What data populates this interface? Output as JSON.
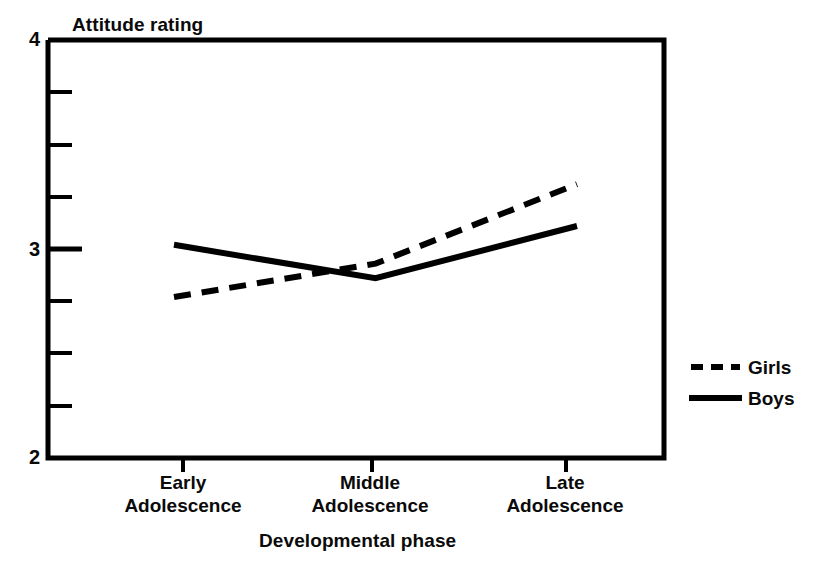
{
  "chart_data": {
    "type": "line",
    "title": "",
    "ylabel": "Attitude rating",
    "xlabel": "Developmental phase",
    "categories": [
      "Early\nAdolescence",
      "Middle\nAdolescence",
      "Late\nAdolescence"
    ],
    "category_labels": [
      {
        "line1": "Early",
        "line2": "Adolescence"
      },
      {
        "line1": "Middle",
        "line2": "Adolescence"
      },
      {
        "line1": "Late",
        "line2": "Adolescence"
      }
    ],
    "ylim": [
      2,
      4
    ],
    "ytick_labels": [
      "4",
      "3",
      "2"
    ],
    "ytick_values": [
      4,
      3,
      2
    ],
    "yminor_step": 0.25,
    "grid": false,
    "legend_position": "right",
    "series": [
      {
        "name": "Girls",
        "style": "dashed",
        "color": "#000000",
        "values": [
          2.77,
          2.93,
          3.31
        ]
      },
      {
        "name": "Boys",
        "style": "solid",
        "color": "#000000",
        "values": [
          3.02,
          2.86,
          3.11
        ]
      }
    ]
  },
  "axis": {
    "y_title": "Attitude rating",
    "x_title": "Developmental phase",
    "y_labels": {
      "top": "4",
      "mid": "3",
      "bottom": "2"
    }
  },
  "legend": {
    "girls_label": "Girls",
    "boys_label": "Boys"
  },
  "colors": {
    "ink": "#000000",
    "background": "#ffffff"
  }
}
